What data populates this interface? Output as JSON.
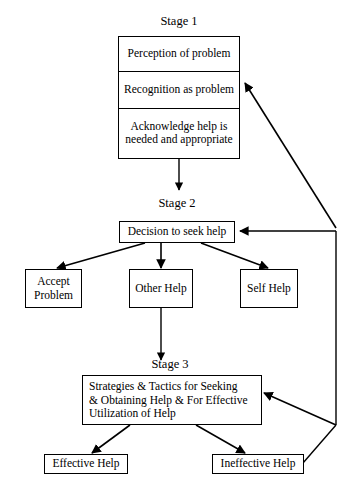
{
  "diagram": {
    "colors": {
      "stroke": "#000000",
      "background": "#ffffff",
      "text": "#000000"
    },
    "stages": {
      "stage1_label": "Stage 1",
      "stage2_label": "Stage 2",
      "stage3_label": "Stage 3"
    },
    "stage1_box": {
      "rows": [
        {
          "text": "Perception of problem"
        },
        {
          "text": "Recognition as problem"
        },
        {
          "line1": "Acknowledge help is",
          "line2": "needed and appropriate"
        }
      ]
    },
    "stage2_box": {
      "text": "Decision to seek help"
    },
    "options": [
      {
        "line1": "Accept",
        "line2": "Problem"
      },
      {
        "line1": "Other Help",
        "line2": ""
      },
      {
        "line1": "Self Help",
        "line2": ""
      }
    ],
    "stage3_box": {
      "line1": "Strategies & Tactics for Seeking",
      "line2": "& Obtaining Help & For Effective",
      "line3": "Utilization of Help"
    },
    "outcomes": [
      {
        "text": "Effective Help"
      },
      {
        "text": "Ineffective Help"
      }
    ]
  }
}
